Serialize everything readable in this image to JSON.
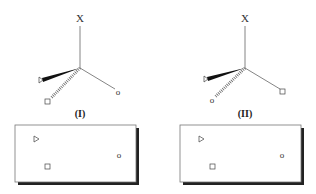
{
  "figure": {
    "molecules": [
      {
        "id": "I",
        "label": "(I)",
        "top_substituent": "X",
        "wedge_substituent": "triangle",
        "hash_substituent": "square",
        "plain_substituent": "o",
        "plain_glyph": "o"
      },
      {
        "id": "II",
        "label": "(II)",
        "top_substituent": "X",
        "wedge_substituent": "triangle",
        "hash_substituent": "o",
        "plain_substituent": "square",
        "hash_glyph": "o"
      }
    ],
    "projection_boxes": [
      {
        "for": "I",
        "items": [
          "triangle",
          "o",
          "square"
        ],
        "o_glyph": "o"
      },
      {
        "for": "II",
        "items": [
          "triangle",
          "o",
          "square"
        ],
        "o_glyph": "o"
      }
    ]
  }
}
